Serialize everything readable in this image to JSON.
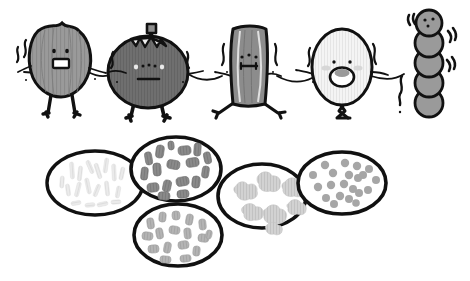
{
  "illustration": {
    "title": "Worried food characters holding hands above microscope views of bacteria",
    "style": "hand-drawn black ink line art with grayscale fills on white background",
    "background_color": "#ffffff",
    "line_color": "#111111"
  },
  "palette": {
    "outline": "#111111",
    "white": "#ffffff",
    "very_light_gray": "#f2f2f2",
    "light_gray": "#cccccc",
    "mid_gray": "#9a9a9a",
    "gray": "#8c8c8c",
    "dark_gray": "#6f6f6f",
    "darker_gray": "#5e5e5e"
  },
  "characters": {
    "group_label": "chain of five worried characters holding hands",
    "count": 5,
    "items": [
      {
        "index": 1,
        "name": "onion-character",
        "shape": "round onion bulb with jagged top",
        "fill": "#9a9a9a",
        "texture": "vertical onion-skin stripes",
        "face": "two dot eyes and open rectangular worried mouth",
        "limbs": "two short legs, two arms reaching out",
        "emotion_marks": "nervous sweat squiggles on left"
      },
      {
        "index": 2,
        "name": "tomato-character",
        "shape": "round fruit with stem and leafy calyx on top",
        "fill": "#6f6f6f",
        "texture": "fine vertical stripes",
        "face": "two small eyes, three freckle dots and flat frowning mouth",
        "limbs": "two short legs, two arms reaching out",
        "emotion_marks": "nervous squiggles both sides"
      },
      {
        "index": 3,
        "name": "log-character",
        "shape": "tree stump / wood log block",
        "fill": "#8c8c8c",
        "texture": "vertical wood grain lines",
        "face": "two dot eyes and small flat gritted mouth",
        "limbs": "two thin splayed legs, two arms reaching out",
        "emotion_marks": "nervous squiggles both sides"
      },
      {
        "index": 4,
        "name": "egg-character",
        "shape": "tall oval egg or garlic bulb",
        "fill": "#f2f2f2",
        "texture": "faint vertical stripes",
        "face": "two dot eyes, blush cheeks and wide open screaming mouth",
        "limbs": "crossed thin legs, two arms reaching out",
        "emotion_marks": "nervous squiggles both sides"
      },
      {
        "index": 5,
        "name": "bead-chain-character",
        "shape": "vertical stack of five circles like a streptococcus chain",
        "fill": "#9a9a9a",
        "bead_count": 5,
        "face": "two dot eyes and small mouth on the top bead only",
        "limbs": "none",
        "emotion_marks": "shake lines on both sides and wiggle squiggle at bottom left"
      }
    ]
  },
  "microscope_views": {
    "group_label": "five oval microscope field views of bacteria",
    "count": 5,
    "items": [
      {
        "index": 1,
        "name": "faint-rods-view",
        "morphology": "very faint pale bacilli rods",
        "fill_color": "#e8e8e8",
        "shape_kind": "rod",
        "density": "sparse",
        "position": "far left, middle height"
      },
      {
        "index": 2,
        "name": "dark-rods-view",
        "morphology": "dark gray rounded rod shaped bacilli",
        "fill_color": "#8a8a8a",
        "shape_kind": "rod",
        "density": "dense",
        "position": "upper second from left"
      },
      {
        "index": 3,
        "name": "mid-rods-view",
        "morphology": "medium gray rounded rod shaped bacilli",
        "fill_color": "#b0b0b0",
        "shape_kind": "rod",
        "density": "dense",
        "position": "lower center"
      },
      {
        "index": 4,
        "name": "cloud-clusters-view",
        "morphology": "light gray irregular cloud like clusters",
        "fill_color": "#cfcfcf",
        "shape_kind": "cluster",
        "density": "medium",
        "position": "center right"
      },
      {
        "index": 5,
        "name": "cocci-dots-view",
        "morphology": "small round gray cocci dots",
        "fill_color": "#a6a6a6",
        "shape_kind": "coccus",
        "density": "medium",
        "position": "far right"
      }
    ]
  }
}
